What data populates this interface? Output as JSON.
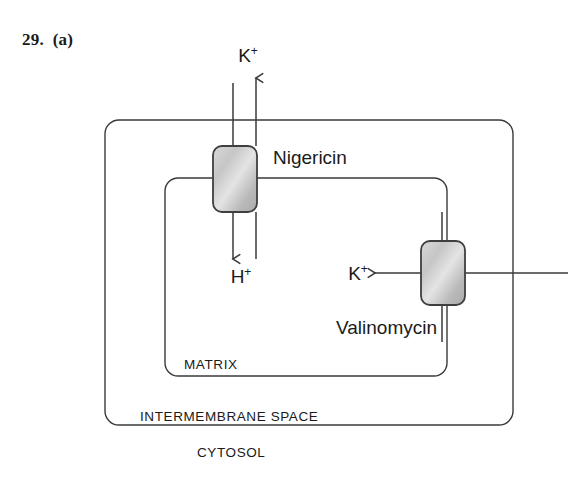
{
  "figure": {
    "question_label": "29.  (a)",
    "compartments": [
      {
        "id": "cytosol",
        "label": "CYTOSOL"
      },
      {
        "id": "intermembrane-space",
        "label": "INTERMEMBRANE SPACE"
      },
      {
        "id": "matrix",
        "label": "MATRIX"
      }
    ],
    "carriers": [
      {
        "id": "nigericin",
        "label": "Nigericin"
      },
      {
        "id": "valinomycin",
        "label": "Valinomycin"
      }
    ],
    "ions": [
      {
        "id": "k-out",
        "label": "K",
        "charge": "+",
        "direction": "up"
      },
      {
        "id": "h-in",
        "label": "H",
        "charge": "+",
        "direction": "down"
      },
      {
        "id": "k-in",
        "label": "K",
        "charge": "+",
        "direction": "left"
      }
    ],
    "colors": {
      "line": "#3a3a3a",
      "carrier_fill_light": "#e2e2e2",
      "carrier_fill_mid": "#bdbdbd",
      "carrier_fill_dark": "#a8a8a8",
      "carrier_stroke": "#3f3f3f",
      "text": "#1a1a1a",
      "background": "#ffffff"
    }
  }
}
